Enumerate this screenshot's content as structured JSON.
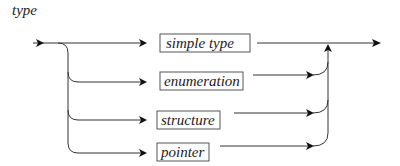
{
  "diagram": {
    "title": "type",
    "kind": "syntax-railroad",
    "alternatives": [
      {
        "label": "simple type"
      },
      {
        "label": "enumeration"
      },
      {
        "label": "structure"
      },
      {
        "label": "pointer"
      }
    ],
    "colors": {
      "line": "#333333",
      "box_border": "#555555",
      "text": "#222222",
      "background": "#ffffff"
    }
  }
}
